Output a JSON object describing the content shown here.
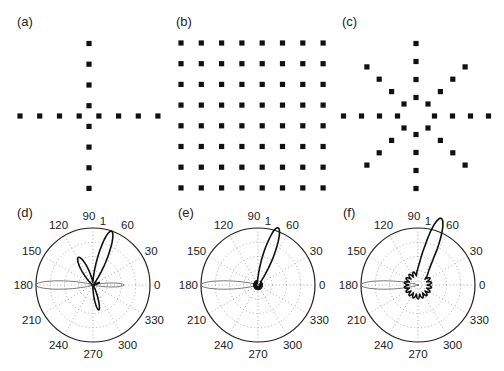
{
  "figure": {
    "panels": [
      {
        "id": "a",
        "label": "(a)",
        "type": "array-layout",
        "description": "cross array"
      },
      {
        "id": "b",
        "label": "(b)",
        "type": "array-layout",
        "description": "8x8 rectangular array"
      },
      {
        "id": "c",
        "label": "(c)",
        "type": "array-layout",
        "description": "star array"
      },
      {
        "id": "d",
        "label": "(d)",
        "type": "polar"
      },
      {
        "id": "e",
        "label": "(e)",
        "type": "polar"
      },
      {
        "id": "f",
        "label": "(f)",
        "type": "polar"
      }
    ],
    "polar_ticks": {
      "angles": [
        "90",
        "60",
        "30",
        "0",
        "330",
        "300",
        "270",
        "240",
        "210",
        "180",
        "150",
        "120"
      ],
      "radius_label": "1"
    },
    "colors": {
      "markers": "#111111",
      "main_beam": "#111111",
      "reference_beam": "#777777",
      "grid": "#888888"
    }
  },
  "chart_data": [
    {
      "type": "scatter",
      "title": "(a)",
      "description": "Cross-shaped sensor array: 8 elements on vertical axis, 8 on horizontal axis, none at center",
      "x": [
        -4,
        -3,
        -2,
        -1,
        1,
        2,
        3,
        4,
        0,
        0,
        0,
        0,
        0,
        0,
        0,
        0
      ],
      "y": [
        0,
        0,
        0,
        0,
        0,
        0,
        0,
        0,
        4,
        3,
        2,
        1,
        -1,
        -2,
        -3,
        -4
      ]
    },
    {
      "type": "scatter",
      "title": "(b)",
      "description": "8 x 8 uniform rectangular array (64 elements)",
      "rows": 8,
      "cols": 8
    },
    {
      "type": "scatter",
      "title": "(c)",
      "description": "Star-shaped array: 8 arms (0,45,90,...,315 deg), 4 elements per arm, no center element",
      "arms_deg": [
        0,
        45,
        90,
        135,
        180,
        225,
        270,
        315
      ],
      "elements_per_arm": 4
    },
    {
      "type": "polar",
      "title": "(d)",
      "theta_ticks": [
        0,
        30,
        60,
        90,
        120,
        150,
        180,
        210,
        240,
        270,
        300,
        330
      ],
      "rmax": 1,
      "series": [
        {
          "name": "beam pattern",
          "main_lobe_deg": 70,
          "main_lobe_r": 1.0,
          "secondary_lobe_deg": 120,
          "secondary_lobe_r": 0.5,
          "back_lobe_deg": 285,
          "back_lobe_r": 0.45
        },
        {
          "name": "reference beam",
          "main_lobe_deg": 180,
          "main_lobe_r": 1.0,
          "side_lobe_deg": 0,
          "side_lobe_r": 0.55
        }
      ]
    },
    {
      "type": "polar",
      "title": "(e)",
      "theta_ticks": [
        0,
        30,
        60,
        90,
        120,
        150,
        180,
        210,
        240,
        270,
        300,
        330
      ],
      "rmax": 1,
      "series": [
        {
          "name": "beam pattern",
          "main_lobe_deg": 70,
          "main_lobe_r": 1.0
        },
        {
          "name": "reference beam",
          "main_lobe_deg": 180,
          "main_lobe_r": 1.0
        }
      ]
    },
    {
      "type": "polar",
      "title": "(f)",
      "theta_ticks": [
        0,
        30,
        60,
        90,
        120,
        150,
        180,
        210,
        240,
        270,
        300,
        330
      ],
      "rmax": 1,
      "series": [
        {
          "name": "beam pattern",
          "main_lobe_deg": 70,
          "main_lobe_r": 1.0,
          "sidelobe_level": 0.2
        },
        {
          "name": "reference beam",
          "main_lobe_deg": 180,
          "main_lobe_r": 1.0
        }
      ]
    }
  ]
}
